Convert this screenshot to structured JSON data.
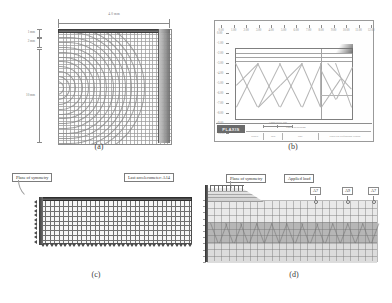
{
  "figure": {
    "type": "four-panel finite element mesh figure",
    "captions": {
      "a": "(a)",
      "b": "(b)",
      "c": "(c)",
      "d": "(d)"
    }
  },
  "panel_a": {
    "name": "axisymmetric distorted mesh",
    "dimension_top": "4.0 mm",
    "dimension_left_top_1": "1 mm",
    "dimension_left_top_2": "2 mm",
    "dimension_left_mid": "10 mm",
    "grid": {
      "columns": 30,
      "rows": 30
    }
  },
  "panel_b": {
    "name": "PLAXIS finite element output sheet",
    "logo": "PLAXIS",
    "x_ticks": [
      "0.00",
      "1.00",
      "2.00",
      "3.00",
      "4.00",
      "5.00",
      "6.00",
      "7.00",
      "8.00",
      "9.00",
      "10.00",
      "11.00",
      "12.00"
    ],
    "y_ticks": [
      "0.00",
      "-1.00",
      "-2.00",
      "-3.00",
      "-4.00",
      "-5.00",
      "-6.00",
      "-7.00",
      "-8.00",
      "-9.00",
      "-10.00"
    ],
    "scale_label": "0          1 m",
    "plot_caption": "Connectivity plot",
    "title_block": {
      "project_label": "Project description",
      "cells": [
        "Project",
        "Step",
        "Date",
        "Plaxis 8.2 Professional version"
      ]
    }
  },
  "panel_c": {
    "name": "refined rectangular mesh model",
    "callouts": {
      "symmetry": "Plane of symmetry",
      "accelerometer": "Last accelerometer: A14"
    },
    "grid": {
      "columns": 34,
      "rows": 9
    }
  },
  "panel_d": {
    "name": "layered soil mesh with applied load",
    "callouts": {
      "symmetry": "Plane of symmetry",
      "load": "Applied load"
    },
    "accelerometers": [
      "A7",
      "A9",
      "A7"
    ],
    "layers": [
      "upper soil layer",
      "middle soil layer",
      "lower soil layer"
    ]
  },
  "colors": {
    "background": "#ffffff",
    "mesh_line": "#6f6f6f",
    "frame": "#4d4d4d",
    "layer_light": "#e9e9e9",
    "layer_dark": "#b6b6b6",
    "text": "#2a2a2a"
  }
}
